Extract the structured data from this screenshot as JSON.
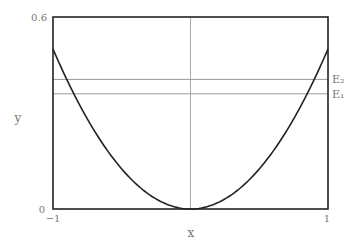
{
  "chart_data": {
    "type": "line",
    "title": "",
    "xlabel": "x",
    "ylabel": "y",
    "xlim": [
      -1,
      1
    ],
    "ylim": [
      0,
      0.6
    ],
    "xticks": [
      "−1",
      "1"
    ],
    "yticks": [
      "0",
      "0.6"
    ],
    "grid": false,
    "series": [
      {
        "name": "potential",
        "function": "0.5*x^2",
        "x": [
          -1,
          -0.75,
          -0.5,
          -0.25,
          0,
          0.25,
          0.5,
          0.75,
          1
        ],
        "y": [
          0.5,
          0.281,
          0.125,
          0.031,
          0,
          0.031,
          0.125,
          0.281,
          0.5
        ]
      }
    ],
    "hlines": [
      {
        "name": "E₂",
        "y": 0.405
      },
      {
        "name": "E₁",
        "y": 0.36
      }
    ],
    "vlines": [
      {
        "x": 0
      }
    ]
  }
}
